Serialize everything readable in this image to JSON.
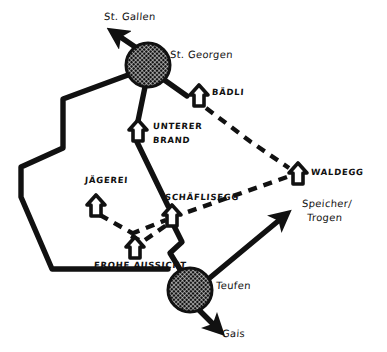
{
  "figure": {
    "name": "hand-drawn-transit-map",
    "background_color": "#ffffff",
    "ink_color": "#111111"
  },
  "nodes": {
    "towns": [
      {
        "id": "st-georgen",
        "label": "St. Georgen",
        "x": 148,
        "y": 65,
        "r": 22
      },
      {
        "id": "teufen",
        "label": "Teufen",
        "x": 190,
        "y": 290,
        "r": 22
      }
    ],
    "stops": [
      {
        "id": "baedli",
        "label": "BÄDLI",
        "x": 199,
        "y": 96
      },
      {
        "id": "unterer-brand",
        "label": "UNTERER\nBRAND",
        "x": 138,
        "y": 130
      },
      {
        "id": "jaegerei",
        "label": "JÄGEREI",
        "x": 96,
        "y": 205
      },
      {
        "id": "schaeflisegg",
        "label": "SCHÄFLISEGG",
        "x": 172,
        "y": 215
      },
      {
        "id": "waldegg",
        "label": "WALDEGG",
        "x": 298,
        "y": 173
      },
      {
        "id": "frohe-aussicht",
        "label": "FROHE AUSSICHT",
        "x": 135,
        "y": 247
      }
    ]
  },
  "destinations": [
    {
      "id": "st-gallen",
      "label": "St. Gallen"
    },
    {
      "id": "speicher-trogen",
      "label": "Speicher/\nTrogen"
    },
    {
      "id": "gais",
      "label": "Gais"
    }
  ],
  "labels": {
    "st_gallen": "St. Gallen",
    "st_georgen": "St. Georgen",
    "baedli": "BÄDLI",
    "unterer_brand_line1": "UNTERER",
    "unterer_brand_line2": "BRAND",
    "jaegerei": "JÄGEREI",
    "schaeflisegg": "SCHÄFLISEGG",
    "waldegg": "WALDEGG",
    "frohe_aussicht": "FROHE AUSSICHT",
    "teufen": "Teufen",
    "speicher_line1": "Speicher/",
    "speicher_line2": "Trogen",
    "gais": "Gais"
  }
}
